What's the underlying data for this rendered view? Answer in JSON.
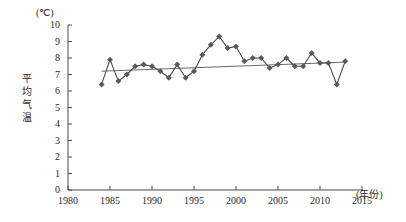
{
  "chart_data": {
    "type": "line",
    "title": "",
    "subtitle": "",
    "xlabel": "(年份)",
    "ylabel": "平均气温",
    "yunit": "(℃)",
    "xlim": [
      1980,
      2015
    ],
    "ylim": [
      0,
      10
    ],
    "grid": false,
    "legend": "none",
    "xticks": [
      1980,
      1985,
      1990,
      1995,
      2000,
      2005,
      2010,
      2015
    ],
    "yticks": [
      0,
      1,
      2,
      3,
      4,
      5,
      6,
      7,
      8,
      9,
      10
    ],
    "marker": "diamond",
    "marker_color": "#5a5a5a",
    "line_color": "#4a4a4a",
    "trend_color": "#6b6b6b",
    "series": [
      {
        "name": "平均气温",
        "x": [
          1984,
          1985,
          1986,
          1987,
          1988,
          1989,
          1990,
          1991,
          1992,
          1993,
          1994,
          1995,
          1996,
          1997,
          1998,
          1999,
          2000,
          2001,
          2002,
          2003,
          2004,
          2005,
          2006,
          2007,
          2008,
          2009,
          2010,
          2011,
          2012,
          2013
        ],
        "values": [
          6.4,
          7.9,
          6.6,
          7.0,
          7.5,
          7.6,
          7.5,
          7.2,
          6.8,
          7.6,
          6.8,
          7.2,
          8.2,
          8.8,
          9.3,
          8.6,
          8.7,
          7.8,
          8.0,
          8.0,
          7.4,
          7.6,
          8.0,
          7.5,
          7.5,
          8.3,
          7.7,
          7.7,
          6.4,
          7.8
        ]
      }
    ],
    "trend_line": {
      "name": "线性趋势线",
      "x": [
        1984,
        2013
      ],
      "values": [
        7.2,
        7.75
      ]
    }
  },
  "axes": {
    "y_tick_labels": [
      "10",
      "9",
      "8",
      "7",
      "6",
      "5",
      "4",
      "3",
      "2",
      "1",
      "0"
    ],
    "x_tick_labels": [
      "1980",
      "1985",
      "1990",
      "1995",
      "2000",
      "2005",
      "2010",
      "2015"
    ],
    "y_label_chars": [
      "平",
      "均",
      "气",
      "温"
    ]
  }
}
